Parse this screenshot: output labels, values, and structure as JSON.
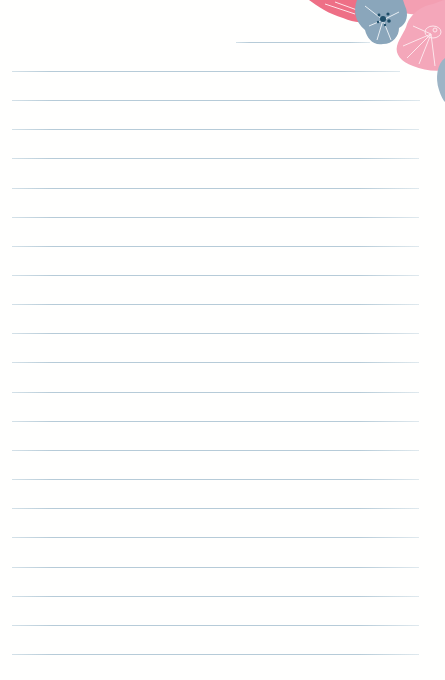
{
  "stationery": {
    "type": "lined-note-paper",
    "header_line": {
      "x1": 236,
      "x2": 370,
      "y": 42
    },
    "lines": [
      {
        "y": 71,
        "x1": 12,
        "x2": 400
      },
      {
        "y": 100,
        "x1": 12,
        "x2": 420
      },
      {
        "y": 129,
        "x1": 12,
        "x2": 419
      },
      {
        "y": 158,
        "x1": 12,
        "x2": 419
      },
      {
        "y": 188,
        "x1": 12,
        "x2": 419
      },
      {
        "y": 217,
        "x1": 12,
        "x2": 419
      },
      {
        "y": 246,
        "x1": 12,
        "x2": 419
      },
      {
        "y": 275,
        "x1": 12,
        "x2": 419
      },
      {
        "y": 304,
        "x1": 12,
        "x2": 419
      },
      {
        "y": 333,
        "x1": 12,
        "x2": 419
      },
      {
        "y": 362,
        "x1": 12,
        "x2": 419
      },
      {
        "y": 392,
        "x1": 12,
        "x2": 419
      },
      {
        "y": 421,
        "x1": 12,
        "x2": 419
      },
      {
        "y": 450,
        "x1": 12,
        "x2": 419
      },
      {
        "y": 479,
        "x1": 12,
        "x2": 419
      },
      {
        "y": 508,
        "x1": 12,
        "x2": 419
      },
      {
        "y": 537,
        "x1": 12,
        "x2": 419
      },
      {
        "y": 567,
        "x1": 12,
        "x2": 419
      },
      {
        "y": 596,
        "x1": 12,
        "x2": 419
      },
      {
        "y": 625,
        "x1": 12,
        "x2": 419
      },
      {
        "y": 654,
        "x1": 12,
        "x2": 419
      }
    ],
    "decoration": {
      "icon": "floral-corner-icon",
      "position": "top-right",
      "colors": {
        "pink_dark": "#ee6f86",
        "pink_light": "#f4a9bb",
        "blue_gray": "#7f9db3",
        "navy_dot": "#1f4e69"
      }
    },
    "line_color": "#b6cbd8",
    "background": "#ffffff"
  }
}
